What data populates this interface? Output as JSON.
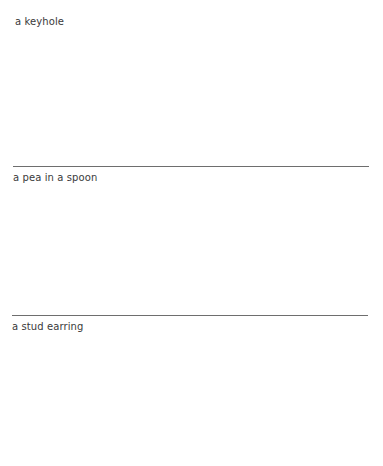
{
  "panels": [
    {
      "label": "a keyhole"
    },
    {
      "label": "a pea in a spoon"
    },
    {
      "label": "a stud earring"
    }
  ],
  "colors": {
    "text": "#3a3a3a",
    "rule": "#6e6e6e",
    "background": "#ffffff"
  }
}
